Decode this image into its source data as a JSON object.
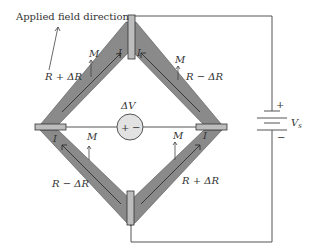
{
  "diagram": {
    "title_annotation": "Applied field direction",
    "arms": {
      "top_left": {
        "resistance": "R + ΔR",
        "magnetization": "M",
        "current": "I"
      },
      "top_right": {
        "resistance": "R − ΔR",
        "magnetization": "M",
        "current": "I"
      },
      "bottom_left": {
        "resistance": "R − ΔR",
        "magnetization": "M",
        "current": "I"
      },
      "bottom_right": {
        "resistance": "R + ΔR",
        "magnetization": "M",
        "current": "I"
      }
    },
    "voltmeter": {
      "label": "ΔV",
      "plus": "+",
      "minus": "−"
    },
    "source": {
      "label": "V",
      "subscript": "s",
      "plus": "+",
      "minus": "−"
    },
    "colors": {
      "arm_fill": "#8a8a8a",
      "contact_fill": "#bdbdbd",
      "wire": "#555555",
      "voltmeter_fill": "#e2e2e2",
      "text": "#333333"
    }
  }
}
